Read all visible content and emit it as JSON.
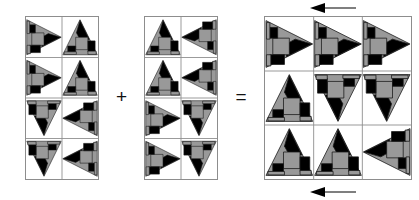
{
  "diagram": {
    "type": "quilt-block-composition",
    "operators": {
      "plus": "+",
      "equals": "="
    },
    "palette": {
      "gray": "#999999",
      "black": "#000000",
      "white": "#ffffff",
      "outline": "#8d8d8d",
      "motif_edge": "#1a1a1a"
    },
    "blocks": [
      {
        "id": "block-a",
        "name": "left-source-block",
        "columns": 2,
        "rows": 4,
        "x": 25,
        "y": 16,
        "width": 74,
        "height": 164,
        "cells": [
          {
            "row": 0,
            "col": 0,
            "motif": "triangle-unit",
            "rotation": 90,
            "visible": true
          },
          {
            "row": 0,
            "col": 1,
            "motif": "triangle-unit",
            "rotation": 0,
            "visible": true
          },
          {
            "row": 1,
            "col": 0,
            "motif": "triangle-unit",
            "rotation": 90,
            "visible": true
          },
          {
            "row": 1,
            "col": 1,
            "motif": "triangle-unit",
            "rotation": 0,
            "visible": true
          },
          {
            "row": 2,
            "col": 0,
            "motif": "triangle-unit",
            "rotation": 180,
            "visible": true
          },
          {
            "row": 2,
            "col": 1,
            "motif": "triangle-unit",
            "rotation": 270,
            "visible": true
          },
          {
            "row": 3,
            "col": 0,
            "motif": "triangle-unit",
            "rotation": 180,
            "visible": true
          },
          {
            "row": 3,
            "col": 1,
            "motif": "triangle-unit",
            "rotation": 270,
            "visible": true
          }
        ]
      },
      {
        "id": "block-b",
        "name": "right-source-block",
        "columns": 2,
        "rows": 4,
        "x": 144,
        "y": 16,
        "width": 74,
        "height": 164,
        "cells": [
          {
            "row": 0,
            "col": 0,
            "motif": "triangle-unit",
            "rotation": 0,
            "visible": true
          },
          {
            "row": 0,
            "col": 1,
            "motif": "triangle-unit",
            "rotation": 270,
            "visible": true
          },
          {
            "row": 1,
            "col": 0,
            "motif": "triangle-unit",
            "rotation": 0,
            "visible": true
          },
          {
            "row": 1,
            "col": 1,
            "motif": "triangle-unit",
            "rotation": 270,
            "visible": true
          },
          {
            "row": 2,
            "col": 0,
            "motif": "triangle-unit",
            "rotation": 90,
            "visible": true
          },
          {
            "row": 2,
            "col": 1,
            "motif": "triangle-unit",
            "rotation": 180,
            "visible": true
          },
          {
            "row": 3,
            "col": 0,
            "motif": "triangle-unit",
            "rotation": 90,
            "visible": true
          },
          {
            "row": 3,
            "col": 1,
            "motif": "triangle-unit",
            "rotation": 180,
            "visible": true
          }
        ]
      },
      {
        "id": "block-c",
        "name": "result-block",
        "columns": 3,
        "rows": 3,
        "x": 264,
        "y": 16,
        "width": 148,
        "height": 164,
        "cells": [
          {
            "row": 0,
            "col": 0,
            "motif": "triangle-unit",
            "rotation": 90,
            "visible": true
          },
          {
            "row": 0,
            "col": 1,
            "motif": "triangle-unit",
            "rotation": 90,
            "visible": true
          },
          {
            "row": 0,
            "col": 2,
            "motif": "triangle-unit",
            "rotation": 90,
            "visible": true
          },
          {
            "row": 1,
            "col": 0,
            "motif": "triangle-unit",
            "rotation": 0,
            "visible": true
          },
          {
            "row": 1,
            "col": 1,
            "motif": "triangle-unit",
            "rotation": 180,
            "visible": true
          },
          {
            "row": 1,
            "col": 2,
            "motif": "triangle-unit",
            "rotation": 180,
            "visible": true
          },
          {
            "row": 2,
            "col": 0,
            "motif": "triangle-unit",
            "rotation": 0,
            "visible": true
          },
          {
            "row": 2,
            "col": 1,
            "motif": "triangle-unit",
            "rotation": 0,
            "visible": true
          },
          {
            "row": 2,
            "col": 2,
            "motif": "triangle-unit",
            "rotation": 270,
            "visible": true
          }
        ]
      }
    ],
    "arrows": [
      {
        "id": "arrow-top",
        "name": "top-direction-arrow",
        "direction": "left",
        "x": 310,
        "y": 2,
        "length": 46
      },
      {
        "id": "arrow-bottom",
        "name": "bottom-direction-arrow",
        "direction": "left",
        "x": 310,
        "y": 186,
        "length": 46
      }
    ]
  }
}
